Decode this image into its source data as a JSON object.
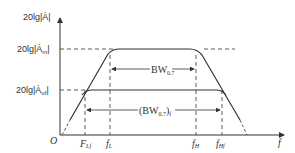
{
  "diagram": {
    "type": "bode-magnitude-plot",
    "y_axis_label": "20lg|Ȧ|",
    "x_axis_label": "f",
    "origin_label": "O",
    "levels": [
      {
        "label_prefix": "20lg|Ȧ",
        "label_sub": "m",
        "label_suffix": "|",
        "description": "midband gain"
      },
      {
        "label_prefix": "20lg|Ȧ",
        "label_sub": "uf",
        "label_suffix": "|",
        "description": "feedback gain"
      }
    ],
    "x_ticks": [
      {
        "main": "F",
        "sub": "Lf"
      },
      {
        "main": "f",
        "sub": "L"
      },
      {
        "main": "f",
        "sub": "H"
      },
      {
        "main": "f",
        "sub": "Hf"
      }
    ],
    "annotations": [
      {
        "main": "BW",
        "sub": "0.7",
        "prefix": "",
        "suffix": ""
      },
      {
        "main": "BW",
        "sub": "0.7",
        "prefix": "(",
        "suffix": ")",
        "trail_sub": "f"
      }
    ]
  }
}
